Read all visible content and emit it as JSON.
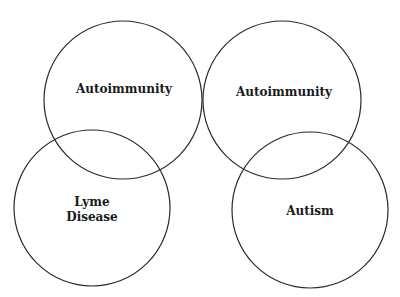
{
  "diagram": {
    "type": "venn-pairs",
    "stroke_color": "#2a2a2a",
    "background": "#ffffff",
    "circles": [
      {
        "id": "top-left",
        "cx": 123,
        "cy": 100,
        "r": 79,
        "label_lines": [
          "Autoimmunity"
        ]
      },
      {
        "id": "bottom-left",
        "cx": 92,
        "cy": 208,
        "r": 78,
        "label_lines": [
          "Lyme",
          "Disease"
        ]
      },
      {
        "id": "top-right",
        "cx": 282,
        "cy": 100,
        "r": 79,
        "label_lines": [
          "Autoimmunity"
        ]
      },
      {
        "id": "bottom-right",
        "cx": 310,
        "cy": 210,
        "r": 78,
        "label_lines": [
          "Autism"
        ]
      }
    ],
    "labels": {
      "top_left": "Autoimmunity",
      "bottom_left_line1": "Lyme",
      "bottom_left_line2": "Disease",
      "top_right": "Autoimmunity",
      "bottom_right": "Autism"
    }
  }
}
